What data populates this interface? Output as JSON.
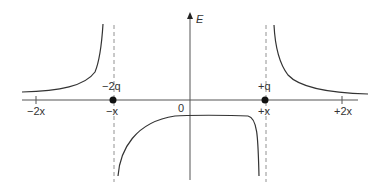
{
  "diagram": {
    "type": "electric-field-vs-position",
    "axis_labels": {
      "y": "E",
      "origin": "0"
    },
    "x_ticks": [
      "-2x",
      "-x",
      "+x",
      "+2x"
    ],
    "charges": [
      {
        "label": "-2q",
        "position": "-x"
      },
      {
        "label": "+q",
        "position": "+x"
      }
    ],
    "colors": {
      "curve": "#333333",
      "axis": "#555555",
      "dashed": "#777777",
      "charge": "#111111"
    }
  },
  "labels": {
    "E": "E",
    "origin": "0",
    "tick_m2x": "−2x",
    "tick_mx": "−x",
    "tick_px": "+x",
    "tick_p2x": "+2x",
    "charge_neg": "−2q",
    "charge_pos": "+q"
  }
}
